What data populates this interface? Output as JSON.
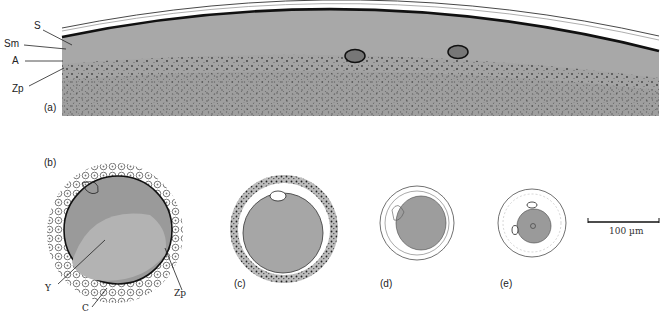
{
  "figure": {
    "panels": [
      {
        "id": "a",
        "label": "(a)",
        "description": "Section of egg surface with layers"
      },
      {
        "id": "b",
        "label": "(b)",
        "description": "Egg with yolk and surrounding cells"
      },
      {
        "id": "c",
        "label": "(c)",
        "description": "Egg with thick granular outer layer"
      },
      {
        "id": "d",
        "label": "(d)",
        "description": "Smaller egg with surrounding membranes"
      },
      {
        "id": "e",
        "label": "(e)",
        "description": "Smallest egg with nuclei"
      }
    ],
    "panel_a_annotations": {
      "s": "S",
      "sm": "Sm",
      "a": "A",
      "zp": "Zp"
    },
    "panel_b_annotations": {
      "y": "Y",
      "c": "C",
      "zp": "Zp"
    },
    "scale_bar": {
      "label": "100 µm",
      "length_px": 71
    },
    "colors": {
      "cytoplasm": "#a9a9a9",
      "membrane": "#111111",
      "background": "#ffffff",
      "granules": "#555555"
    }
  }
}
